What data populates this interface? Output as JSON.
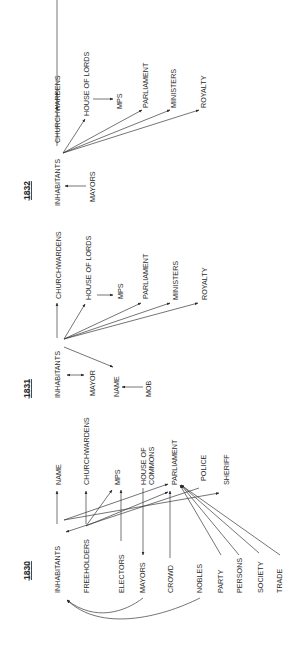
{
  "diagram": {
    "orientation": "rotated-90-ccw",
    "panels": [
      {
        "year": "1832",
        "nodes": {
          "inhabitants": "INHABITANTS",
          "churchwardens": "CHURCHWARDENS",
          "house_of_lords": "HOUSE OF LORDS",
          "mps": "MPS",
          "parliament": "PARLIAMENT",
          "ministers": "MINISTERS",
          "royalty": "ROYALTY",
          "mayors": "MAYORS"
        },
        "edges": [
          {
            "from": "INHABITANTS",
            "to": "CHURCHWARDENS",
            "type": "bidirectional"
          },
          {
            "from": "INHABITANTS",
            "to": "HOUSE OF LORDS"
          },
          {
            "from": "HOUSE OF LORDS",
            "to": "MPS"
          },
          {
            "from": "INHABITANTS",
            "to": "PARLIAMENT"
          },
          {
            "from": "INHABITANTS",
            "to": "MINISTERS"
          },
          {
            "from": "INHABITANTS",
            "to": "ROYALTY"
          },
          {
            "from": "MAYORS",
            "to": "INHABITANTS"
          }
        ]
      },
      {
        "year": "1831",
        "nodes": {
          "inhabitants": "INHABITANTS",
          "churchwardens": "CHURCHWARDENS",
          "house_of_lords": "HOUSE OF LORDS",
          "mps": "MPS",
          "parliament": "PARLIAMENT",
          "ministers": "MINISTERS",
          "royalty": "ROYALTY",
          "mayor": "MAYOR",
          "name": "NAME",
          "mob": "MOB"
        },
        "edges": [
          {
            "from": "INHABITANTS",
            "to": "CHURCHWARDENS"
          },
          {
            "from": "INHABITANTS",
            "to": "HOUSE OF LORDS"
          },
          {
            "from": "HOUSE OF LORDS",
            "to": "MPS"
          },
          {
            "from": "INHABITANTS",
            "to": "PARLIAMENT"
          },
          {
            "from": "INHABITANTS",
            "to": "MINISTERS"
          },
          {
            "from": "INHABITANTS",
            "to": "ROYALTY"
          },
          {
            "from": "INHABITANTS",
            "to": "MAYOR",
            "type": "bidirectional"
          },
          {
            "from": "INHABITANTS",
            "to": "NAME"
          },
          {
            "from": "MOB",
            "to": "NAME"
          }
        ]
      },
      {
        "year": "1830",
        "nodes": {
          "inhabitants": "INHABITANTS",
          "freeholders": "FREEHOLDERS",
          "electors": "ELECTORS",
          "mayors": "MAYORS",
          "crowd": "CROWD",
          "nobles": "NOBLES",
          "party": "PARTY",
          "persons": "PERSONS",
          "society": "SOCIETY",
          "trade": "TRADE",
          "name": "NAME",
          "churchwardens": "CHURCHWARDENS",
          "mps": "MPS",
          "house_of_commons_1": "HOUSE OF",
          "house_of_commons_2": "COMMONS",
          "parliament": "PARLIAMENT",
          "police": "POLICE",
          "sheriff": "SHERIFF"
        },
        "edges": [
          {
            "from": "INHABITANTS",
            "to": "NAME"
          },
          {
            "from": "INHABITANTS",
            "to": "PARLIAMENT"
          },
          {
            "from": "INHABITANTS",
            "to": "SHERIFF"
          },
          {
            "from": "FREEHOLDERS",
            "to": "CHURCHWARDENS"
          },
          {
            "from": "FREEHOLDERS",
            "to": "MPS"
          },
          {
            "from": "FREEHOLDERS",
            "to": "PARLIAMENT"
          },
          {
            "from": "POLICE",
            "to": "INHABITANTS"
          },
          {
            "from": "ELECTORS",
            "to": "MPS"
          },
          {
            "from": "HOUSE OF COMMONS",
            "to": "MAYORS"
          },
          {
            "from": "CROWD",
            "to": "PARLIAMENT"
          },
          {
            "from": "PARTY",
            "to": "PARLIAMENT"
          },
          {
            "from": "PERSONS",
            "to": "PARLIAMENT"
          },
          {
            "from": "SOCIETY",
            "to": "PARLIAMENT"
          },
          {
            "from": "TRADE",
            "to": "PARLIAMENT"
          },
          {
            "from": "MAYORS",
            "to": "INHABITANTS",
            "type": "curved"
          },
          {
            "from": "NOBLES",
            "to": "INHABITANTS",
            "type": "curved"
          }
        ]
      }
    ]
  }
}
